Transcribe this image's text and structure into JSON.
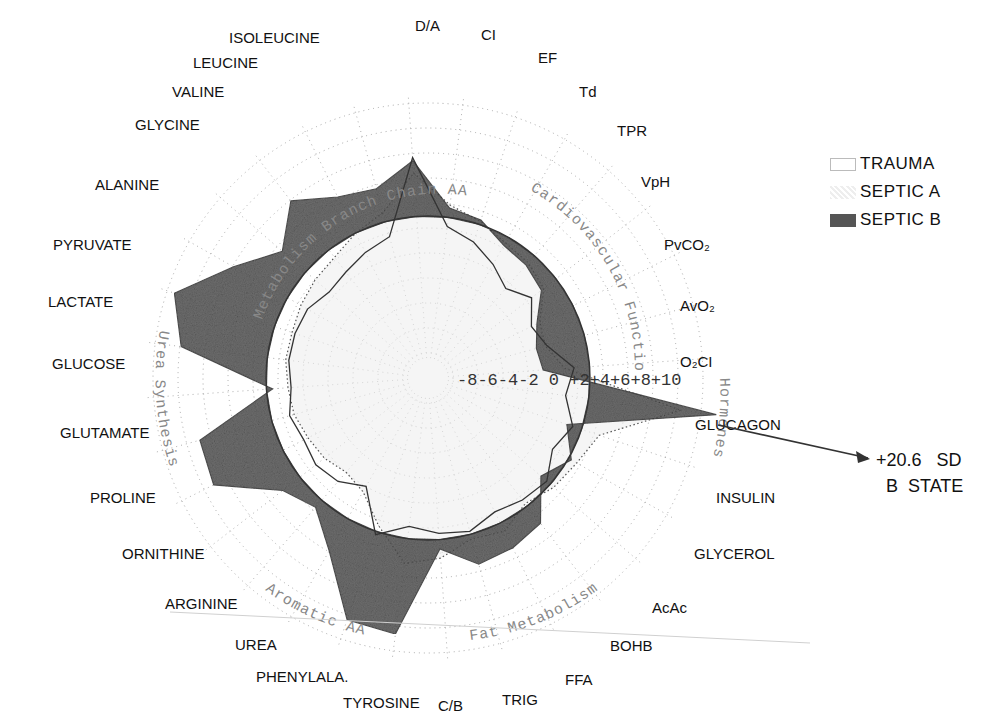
{
  "chart_data": {
    "type": "radar",
    "title": "",
    "units": "SD from reference (0 = TRAUMA reference circle)",
    "radial_ticks": [
      "-8",
      "-6",
      "-4",
      "-2",
      "0",
      "+2",
      "+4",
      "+6",
      "+8",
      "+10"
    ],
    "radial_range": [
      -8,
      10
    ],
    "grid": "dotted concentric circles and dotted spokes",
    "axes": [
      "D/A",
      "CI",
      "EF",
      "Td",
      "TPR",
      "VpH",
      "PvCO2",
      "AvO2",
      "O2CI",
      "GLUCAGON",
      "INSULIN",
      "GLYCEROL",
      "AcAc",
      "BOHB",
      "FFA",
      "TRIG",
      "C/B",
      "TYROSINE",
      "PHENYLALA.",
      "UREA",
      "ARGININE",
      "ORNITHINE",
      "PROLINE",
      "GLUTAMATE",
      "GLUCOSE",
      "LACTATE",
      "PYRUVATE",
      "ALANINE",
      "GLYCINE",
      "VALINE",
      "LEUCINE",
      "ISOLEUCINE"
    ],
    "axis_labels_display": [
      "D/A",
      "CI",
      "EF",
      "Td",
      "TPR",
      "VpH",
      "PvCO₂",
      "AvO₂",
      "O₂CI",
      "GLUCAGON",
      "INSULIN",
      "GLYCEROL",
      "AcAc",
      "BOHB",
      "FFA",
      "TRIG",
      "C/B",
      "TYROSINE",
      "PHENYLALA.",
      "UREA",
      "ARGININE",
      "ORNITHINE",
      "PROLINE",
      "GLUTAMATE",
      "GLUCOSE",
      "LACTATE",
      "PYRUVATE",
      "ALANINE",
      "GLYCINE",
      "VALINE",
      "LEUCINE",
      "ISOLEUCINE"
    ],
    "series": [
      {
        "name": "TRAUMA",
        "style": "thin solid line",
        "values": [
          3.8,
          -0.6,
          -1.2,
          -2.0,
          -2.8,
          -2.0,
          -3.0,
          -2.5,
          -1.0,
          -1.5,
          -0.6,
          -1.2,
          -0.3,
          -0.5,
          -0.8,
          -0.2,
          -0.4,
          -0.8,
          0.2,
          -2.4,
          -1.6,
          -1.3,
          -1.5,
          -1.2,
          -1.6,
          -1.4,
          -1.4,
          -1.5,
          -2.0,
          -1.8,
          -1.4,
          -1.0
        ]
      },
      {
        "name": "SEPTIC A",
        "style": "dotted outline, light stipple fill",
        "values": [
          2.8,
          0.8,
          0.2,
          -0.4,
          -0.6,
          -1.0,
          -2.4,
          -2.6,
          -1.6,
          6.0,
          1.2,
          0.6,
          0.3,
          -0.2,
          0.6,
          0.3,
          1.2,
          1.6,
          -0.4,
          -2.0,
          -2.4,
          -2.0,
          -1.8,
          -1.5,
          -1.4,
          -1.2,
          -1.2,
          -1.0,
          -0.8,
          -0.6,
          0.0,
          0.6
        ]
      },
      {
        "name": "SEPTIC B",
        "style": "dark shaded fill",
        "values": [
          3.6,
          0.6,
          0.3,
          -0.6,
          -0.8,
          -1.2,
          -2.6,
          -3.2,
          -3.0,
          20.6,
          -1.0,
          0.2,
          -0.8,
          1.4,
          1.8,
          2.0,
          0.6,
          6.2,
          6.0,
          2.4,
          0.6,
          1.4,
          5.0,
          4.8,
          -0.4,
          5.6,
          6.8,
          4.0,
          2.0,
          4.0,
          2.6,
          2.2
        ]
      }
    ],
    "group_labels": [
      "Branch Chain AA Metabolism",
      "Cardiovascular Function",
      "Hormones",
      "Fat Metabolism",
      "Aromatic AA",
      "Urea Synthesis",
      "Glucose Metabolism"
    ],
    "legend": {
      "position": "right",
      "entries": [
        "TRAUMA",
        "SEPTIC A",
        "SEPTIC B"
      ]
    },
    "annotations": [
      "+20.6 SD",
      "B STATE"
    ]
  },
  "legend": {
    "items": [
      {
        "label": "TRAUMA"
      },
      {
        "label": "SEPTIC  A"
      },
      {
        "label": "SEPTIC  B"
      }
    ]
  },
  "annotation": {
    "line1": "+20.6   SD",
    "line2": "  B  STATE"
  },
  "scale_text": "-8-6-4-2 0 +2+4+6+8+10",
  "group_texts": {
    "bcaa": "Metabolism Branch Chain AA",
    "cardio": "Cardiovascular Function",
    "hormones": "Hormones",
    "fat": "Fat Metabolism",
    "aromatic": "Aromatic AA",
    "urea": "Urea Synthesis",
    "glucose": "Glucose"
  },
  "colors": {
    "septic_b_fill": "#555555",
    "septic_a_fill": "#d8d8d8",
    "trauma_line": "#333333",
    "grid": "#9a9a9a"
  }
}
